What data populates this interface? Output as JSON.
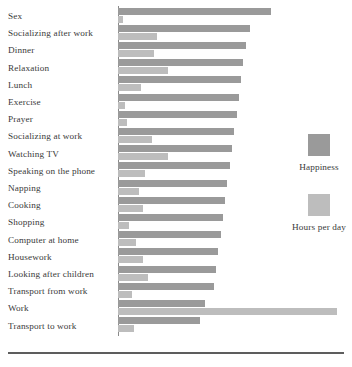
{
  "chart_data": {
    "type": "bar",
    "orientation": "horizontal",
    "title": "",
    "subtitle": "",
    "xlabel": "",
    "ylabel": "",
    "grid": false,
    "legend_position": "right",
    "axis_tick_labels": [],
    "xlim": [
      0,
      10
    ],
    "categories": [
      "Sex",
      "Socializing after work",
      "Dinner",
      "Relaxation",
      "Lunch",
      "Exercise",
      "Prayer",
      "Socializing at work",
      "Watching TV",
      "Speaking on the phone",
      "Napping",
      "Cooking",
      "Shopping",
      "Computer at home",
      "Housework",
      "Looking after children",
      "Transport from work",
      "Work",
      "Transport to work"
    ],
    "series": [
      {
        "name": "Happiness",
        "color": "#9a9a9a",
        "values": [
          6.7,
          5.8,
          5.6,
          5.5,
          5.4,
          5.3,
          5.2,
          5.1,
          5.0,
          4.9,
          4.8,
          4.7,
          4.6,
          4.5,
          4.4,
          4.3,
          4.2,
          3.8,
          3.6
        ]
      },
      {
        "name": "Hours per day",
        "color": "#bdbdbd",
        "values": [
          0.2,
          1.7,
          1.6,
          2.2,
          1.0,
          0.3,
          0.4,
          1.5,
          2.2,
          1.2,
          0.9,
          1.1,
          0.5,
          0.8,
          1.1,
          1.3,
          0.6,
          9.6,
          0.7
        ]
      }
    ]
  },
  "legend": {
    "entries": [
      {
        "label": "Happiness",
        "color": "#9a9a9a"
      },
      {
        "label": "Hours per day",
        "color": "#bdbdbd"
      }
    ]
  },
  "colors": {
    "happiness": "#9a9a9a",
    "hours_per_day": "#bdbdbd",
    "axis": "#8a8a8a",
    "rule": "#5d5d5d",
    "text": "#3a3a3a",
    "background": "#ffffff"
  }
}
